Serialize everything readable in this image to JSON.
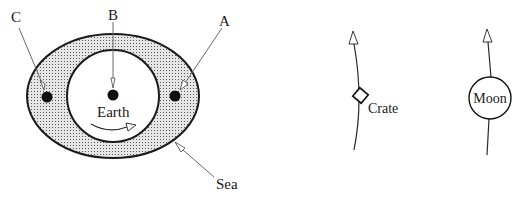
{
  "diagram": {
    "labels": {
      "point_a": "A",
      "point_b": "B",
      "point_c": "C",
      "earth": "Earth",
      "sea": "Sea",
      "crate": "Crate",
      "moon": "Moon"
    },
    "colors": {
      "ink": "#1a1a1a",
      "leader": "#6a6a6a",
      "sea_fill": "#d9d9d9",
      "sea_dots": "#5a5a5a",
      "background": "#ffffff"
    }
  }
}
